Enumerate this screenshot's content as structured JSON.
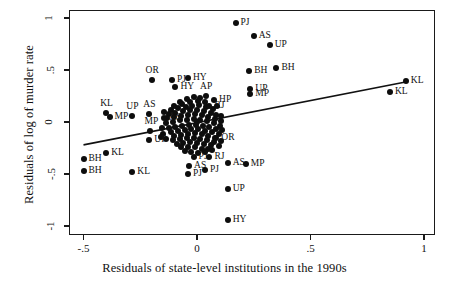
{
  "chart_data": {
    "type": "scatter",
    "title": "",
    "xlabel": "Residuals of state-level institutions in the 1990s",
    "ylabel": "Residuals of log of murder rate",
    "xlim": [
      -0.55,
      1.05
    ],
    "ylim": [
      -1.12,
      1.12
    ],
    "xticks": [
      -0.5,
      0,
      0.5,
      1
    ],
    "xticklabels": [
      "-.5",
      "0",
      ".5",
      "1"
    ],
    "yticks": [
      -1,
      -0.5,
      0,
      0.5,
      1
    ],
    "yticklabels": [
      "-1",
      "-.5",
      "0",
      ".5",
      "1"
    ],
    "grid": false,
    "legend": null,
    "fit_line": {
      "x0": -0.5,
      "y0": -0.22,
      "x1": 0.93,
      "y1": 0.39
    },
    "labeled_points": [
      {
        "x": 0.17,
        "y": 0.95,
        "label": "PJ",
        "lp": "right"
      },
      {
        "x": 0.25,
        "y": 0.83,
        "label": "AS",
        "lp": "right"
      },
      {
        "x": 0.32,
        "y": 0.74,
        "label": "UP",
        "lp": "right"
      },
      {
        "x": 0.35,
        "y": 0.52,
        "label": "BH",
        "lp": "right"
      },
      {
        "x": 0.23,
        "y": 0.49,
        "label": "BH",
        "lp": "right"
      },
      {
        "x": 0.92,
        "y": 0.39,
        "label": "KL",
        "lp": "right"
      },
      {
        "x": 0.85,
        "y": 0.29,
        "label": "KL",
        "lp": "right"
      },
      {
        "x": -0.2,
        "y": 0.4,
        "label": "OR",
        "lp": "above"
      },
      {
        "x": -0.11,
        "y": 0.4,
        "label": "PJ",
        "lp": "right"
      },
      {
        "x": -0.04,
        "y": 0.42,
        "label": "HY",
        "lp": "right"
      },
      {
        "x": -0.095,
        "y": 0.34,
        "label": "HY",
        "lp": "right"
      },
      {
        "x": 0.235,
        "y": 0.32,
        "label": "UP",
        "lp": "right"
      },
      {
        "x": 0.235,
        "y": 0.27,
        "label": "MP",
        "lp": "right"
      },
      {
        "x": 0.04,
        "y": 0.25,
        "label": "AP",
        "lp": "above"
      },
      {
        "x": 0.075,
        "y": 0.215,
        "label": "HP",
        "lp": "right"
      },
      {
        "x": 0.055,
        "y": 0.15,
        "label": "RJ",
        "lp": "right"
      },
      {
        "x": -0.4,
        "y": 0.09,
        "label": "KL",
        "lp": "above"
      },
      {
        "x": -0.385,
        "y": 0.045,
        "label": "MP",
        "lp": "right"
      },
      {
        "x": -0.285,
        "y": 0.055,
        "label": "UP",
        "lp": "above"
      },
      {
        "x": -0.21,
        "y": 0.075,
        "label": "AS",
        "lp": "above"
      },
      {
        "x": -0.145,
        "y": 0.035,
        "label": "AS",
        "lp": "right"
      },
      {
        "x": -0.205,
        "y": -0.09,
        "label": "MP",
        "lp": "above"
      },
      {
        "x": -0.21,
        "y": -0.175,
        "label": "UP",
        "lp": "right"
      },
      {
        "x": 0.085,
        "y": -0.15,
        "label": "OR",
        "lp": "right"
      },
      {
        "x": -0.4,
        "y": -0.3,
        "label": "KL",
        "lp": "right"
      },
      {
        "x": -0.5,
        "y": -0.36,
        "label": "BH",
        "lp": "right"
      },
      {
        "x": -0.5,
        "y": -0.47,
        "label": "BH",
        "lp": "right"
      },
      {
        "x": -0.285,
        "y": -0.48,
        "label": "KL",
        "lp": "right"
      },
      {
        "x": -0.035,
        "y": -0.42,
        "label": "AS",
        "lp": "right"
      },
      {
        "x": -0.04,
        "y": -0.5,
        "label": "PJ",
        "lp": "right"
      },
      {
        "x": 0.035,
        "y": -0.46,
        "label": "PJ",
        "lp": "right"
      },
      {
        "x": -0.015,
        "y": -0.335,
        "label": "PJ",
        "lp": "right"
      },
      {
        "x": 0.055,
        "y": -0.335,
        "label": "RJ",
        "lp": "right"
      },
      {
        "x": 0.135,
        "y": -0.39,
        "label": "AS",
        "lp": "right"
      },
      {
        "x": 0.215,
        "y": -0.4,
        "label": "MP",
        "lp": "right"
      },
      {
        "x": 0.135,
        "y": -0.64,
        "label": "UP",
        "lp": "right"
      },
      {
        "x": 0.135,
        "y": -0.94,
        "label": "HY",
        "lp": "right"
      }
    ],
    "cluster_points": [
      {
        "x": -0.075,
        "y": 0.195
      },
      {
        "x": -0.045,
        "y": 0.225
      },
      {
        "x": -0.015,
        "y": 0.245
      },
      {
        "x": 0.015,
        "y": 0.235
      },
      {
        "x": -0.1,
        "y": 0.155
      },
      {
        "x": -0.065,
        "y": 0.175
      },
      {
        "x": -0.03,
        "y": 0.19
      },
      {
        "x": 0.005,
        "y": 0.205
      },
      {
        "x": 0.035,
        "y": 0.19
      },
      {
        "x": -0.115,
        "y": 0.115
      },
      {
        "x": -0.085,
        "y": 0.135
      },
      {
        "x": -0.05,
        "y": 0.145
      },
      {
        "x": -0.02,
        "y": 0.155
      },
      {
        "x": 0.01,
        "y": 0.16
      },
      {
        "x": 0.04,
        "y": 0.145
      },
      {
        "x": 0.07,
        "y": 0.125
      },
      {
        "x": -0.125,
        "y": 0.075
      },
      {
        "x": -0.095,
        "y": 0.09
      },
      {
        "x": -0.06,
        "y": 0.105
      },
      {
        "x": -0.03,
        "y": 0.115
      },
      {
        "x": 0.0,
        "y": 0.12
      },
      {
        "x": 0.03,
        "y": 0.105
      },
      {
        "x": 0.06,
        "y": 0.09
      },
      {
        "x": 0.085,
        "y": 0.065
      },
      {
        "x": -0.13,
        "y": 0.035
      },
      {
        "x": -0.1,
        "y": 0.05
      },
      {
        "x": -0.07,
        "y": 0.06
      },
      {
        "x": -0.04,
        "y": 0.07
      },
      {
        "x": -0.01,
        "y": 0.075
      },
      {
        "x": 0.02,
        "y": 0.065
      },
      {
        "x": 0.05,
        "y": 0.05
      },
      {
        "x": 0.08,
        "y": 0.03
      },
      {
        "x": 0.105,
        "y": 0.01
      },
      {
        "x": -0.135,
        "y": -0.01
      },
      {
        "x": -0.105,
        "y": 0.0
      },
      {
        "x": -0.075,
        "y": 0.015
      },
      {
        "x": -0.045,
        "y": 0.02
      },
      {
        "x": -0.015,
        "y": 0.025
      },
      {
        "x": 0.015,
        "y": 0.02
      },
      {
        "x": 0.045,
        "y": 0.005
      },
      {
        "x": 0.075,
        "y": -0.01
      },
      {
        "x": 0.1,
        "y": -0.035
      },
      {
        "x": -0.125,
        "y": -0.055
      },
      {
        "x": -0.095,
        "y": -0.045
      },
      {
        "x": -0.065,
        "y": -0.035
      },
      {
        "x": -0.035,
        "y": -0.03
      },
      {
        "x": -0.005,
        "y": -0.025
      },
      {
        "x": 0.025,
        "y": -0.035
      },
      {
        "x": 0.055,
        "y": -0.05
      },
      {
        "x": 0.085,
        "y": -0.07
      },
      {
        "x": -0.115,
        "y": -0.095
      },
      {
        "x": -0.085,
        "y": -0.085
      },
      {
        "x": -0.055,
        "y": -0.075
      },
      {
        "x": -0.025,
        "y": -0.07
      },
      {
        "x": 0.005,
        "y": -0.07
      },
      {
        "x": 0.035,
        "y": -0.085
      },
      {
        "x": 0.065,
        "y": -0.1
      },
      {
        "x": 0.095,
        "y": -0.115
      },
      {
        "x": -0.1,
        "y": -0.135
      },
      {
        "x": -0.07,
        "y": -0.125
      },
      {
        "x": -0.04,
        "y": -0.115
      },
      {
        "x": -0.01,
        "y": -0.11
      },
      {
        "x": 0.02,
        "y": -0.12
      },
      {
        "x": 0.05,
        "y": -0.135
      },
      {
        "x": 0.08,
        "y": -0.15
      },
      {
        "x": -0.135,
        "y": -0.16
      },
      {
        "x": -0.105,
        "y": -0.175
      },
      {
        "x": -0.075,
        "y": -0.165
      },
      {
        "x": -0.045,
        "y": -0.155
      },
      {
        "x": -0.015,
        "y": -0.15
      },
      {
        "x": 0.015,
        "y": -0.16
      },
      {
        "x": 0.045,
        "y": -0.175
      },
      {
        "x": 0.075,
        "y": -0.19
      },
      {
        "x": -0.09,
        "y": -0.21
      },
      {
        "x": -0.06,
        "y": -0.2
      },
      {
        "x": -0.03,
        "y": -0.195
      },
      {
        "x": 0.0,
        "y": -0.2
      },
      {
        "x": 0.03,
        "y": -0.215
      },
      {
        "x": 0.06,
        "y": -0.225
      },
      {
        "x": -0.07,
        "y": -0.245
      },
      {
        "x": -0.04,
        "y": -0.24
      },
      {
        "x": -0.01,
        "y": -0.245
      },
      {
        "x": 0.02,
        "y": -0.255
      },
      {
        "x": 0.05,
        "y": -0.26
      },
      {
        "x": -0.025,
        "y": -0.29
      },
      {
        "x": 0.005,
        "y": -0.295
      },
      {
        "x": 0.035,
        "y": -0.285
      },
      {
        "x": 0.065,
        "y": -0.27
      },
      {
        "x": -0.055,
        "y": -0.28
      },
      {
        "x": 0.095,
        "y": -0.23
      },
      {
        "x": 0.105,
        "y": -0.185
      },
      {
        "x": 0.11,
        "y": -0.08
      },
      {
        "x": 0.105,
        "y": 0.055
      },
      {
        "x": 0.09,
        "y": 0.155
      },
      {
        "x": -0.15,
        "y": -0.115
      },
      {
        "x": -0.155,
        "y": -0.06
      },
      {
        "x": -0.145,
        "y": 0.1
      },
      {
        "x": -0.16,
        "y": -0.145
      },
      {
        "x": 0.0,
        "y": 0.0
      }
    ]
  },
  "axis": {
    "x_title": "Residuals of state-level institutions in the 1990s",
    "y_title": "Residuals of log of murder rate"
  }
}
